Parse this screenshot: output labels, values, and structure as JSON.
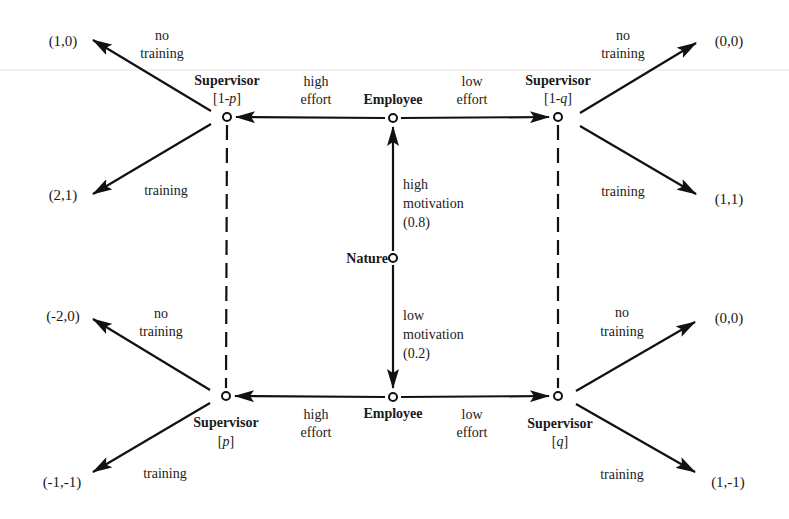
{
  "figure": {
    "type": "extensive-form game tree",
    "scan_line_y": 70
  },
  "nodes": {
    "nature": {
      "label": "Nature",
      "x": 393,
      "y": 258
    },
    "employee_high": {
      "label": "Employee",
      "x": 393,
      "y": 118
    },
    "employee_low": {
      "label": "Employee",
      "x": 393,
      "y": 397
    },
    "sup_tl": {
      "label": "Supervisor",
      "belief": "[1-p]",
      "belief_pre": "[1-",
      "belief_var": "p",
      "belief_post": "]",
      "x": 227,
      "y": 117
    },
    "sup_tr": {
      "label": "Supervisor",
      "belief": "[1-q]",
      "belief_pre": "[1-",
      "belief_var": "q",
      "belief_post": "]",
      "x": 558,
      "y": 117
    },
    "sup_bl": {
      "label": "Supervisor",
      "belief": "[p]",
      "belief_pre": "[",
      "belief_var": "p",
      "belief_post": "]",
      "x": 226,
      "y": 396
    },
    "sup_br": {
      "label": "Supervisor",
      "belief": "[q]",
      "belief_pre": "[",
      "belief_var": "q",
      "belief_post": "]",
      "x": 558,
      "y": 396
    }
  },
  "nature_moves": {
    "high": {
      "line1": "high",
      "line2": "motivation",
      "prob": "(0.8)"
    },
    "low": {
      "line1": "low",
      "line2": "motivation",
      "prob": "(0.2)"
    }
  },
  "employee_moves": {
    "high_left": {
      "line1": "high",
      "line2": "effort"
    },
    "high_right": {
      "line1": "low",
      "line2": "effort"
    },
    "low_left": {
      "line1": "high",
      "line2": "effort"
    },
    "low_right": {
      "line1": "low",
      "line2": "effort"
    }
  },
  "supervisor_moves": {
    "tl_up": {
      "line1": "no",
      "line2": "training"
    },
    "tl_down": {
      "line1": "training"
    },
    "tr_up": {
      "line1": "no",
      "line2": "training"
    },
    "tr_down": {
      "line1": "training"
    },
    "bl_up": {
      "line1": "no",
      "line2": "training"
    },
    "bl_down": {
      "line1": "training"
    },
    "br_up": {
      "line1": "no",
      "line2": "training"
    },
    "br_down": {
      "line1": "training"
    }
  },
  "payoffs": {
    "tl_up": "(1,0)",
    "tl_down": "(2,1)",
    "tr_up": "(0,0)",
    "tr_down": "(1,1)",
    "bl_up": "(-2,0)",
    "bl_down": "(-1,-1)",
    "br_up": "(0,0)",
    "br_down": "(1,-1)"
  }
}
